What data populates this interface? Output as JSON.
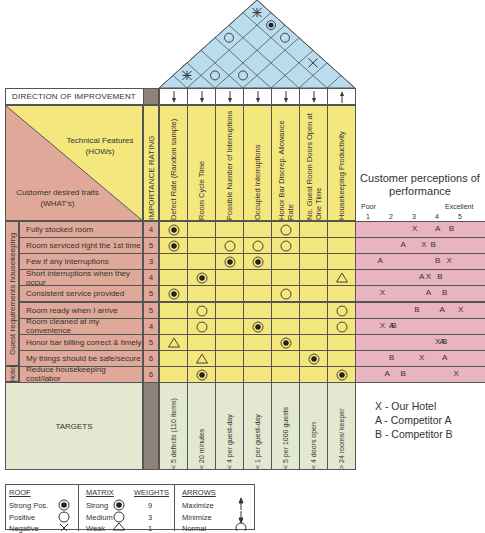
{
  "direction_of_improvement": {
    "label": "DIRECTION OF IMPROVEMENT",
    "arrows": [
      "minimize",
      "minimize",
      "minimize",
      "minimize",
      "minimize",
      "minimize",
      "maximize"
    ]
  },
  "corner": {
    "hows_label": "Technical Features",
    "hows_sub": "(HOWs)",
    "whats_label": "Customer desired traits",
    "whats_sub": "(WHAT's)"
  },
  "importance_header": "IMPORTANCE RATING",
  "technical_features": [
    "Defect Rate (Random sample)",
    "Room Cycle Time",
    "Possible Number of Interruptions",
    "Occupied Interruptions",
    "Honor Bar Discrep. Allowance Rate",
    "No. Guest Room Doors Open at One Time",
    "Housekeeping Productivity"
  ],
  "group_labels": {
    "guest": "Guest requirements housekeeping",
    "hotel": "Hotel"
  },
  "customer_requirements": [
    {
      "label": "Fully stocked room",
      "importance": "4",
      "relations": [
        "strong",
        "",
        "",
        "",
        "medium",
        "",
        ""
      ],
      "perception": {
        "X": 3,
        "A": 4,
        "B": 4.6
      }
    },
    {
      "label": "Room serviced right the 1st time",
      "importance": "5",
      "relations": [
        "strong",
        "",
        "medium",
        "medium",
        "medium",
        "",
        ""
      ],
      "perception": {
        "A": 2.5,
        "X": 3.4,
        "B": 3.8
      }
    },
    {
      "label": "Few if any interruptions",
      "importance": "3",
      "relations": [
        "",
        "",
        "strong",
        "strong",
        "",
        "",
        ""
      ],
      "perception": {
        "A": 1.5,
        "B": 4,
        "X": 4.5
      }
    },
    {
      "label": "Short interruptions when they occur",
      "importance": "4",
      "relations": [
        "",
        "strong",
        "",
        "",
        "",
        "",
        "weak"
      ],
      "perception": {
        "A": 3.3,
        "X": 3.6,
        "B": 4.1
      }
    },
    {
      "label": "Consistent service provided",
      "importance": "5",
      "relations": [
        "strong",
        "",
        "",
        "",
        "medium",
        "",
        ""
      ],
      "perception": {
        "X": 1.6,
        "A": 3.6,
        "B": 4.3
      }
    },
    {
      "label": "Room ready when I arrive",
      "importance": "5",
      "relations": [
        "",
        "medium",
        "",
        "",
        "",
        "",
        "medium"
      ],
      "perception": {
        "B": 3.1,
        "A": 4.2,
        "X": 5
      }
    },
    {
      "label": "Room cleaned at my convenience",
      "importance": "4",
      "relations": [
        "",
        "medium",
        "",
        "strong",
        "",
        "",
        "medium"
      ],
      "perception": {
        "X": 1.6,
        "A": 2,
        "B": 2.1
      }
    },
    {
      "label": "Honor bar billing correct & timely",
      "importance": "5",
      "relations": [
        "weak",
        "",
        "",
        "",
        "strong",
        "",
        ""
      ],
      "perception": {
        "X": 4,
        "A": 4.2,
        "B": 4.3
      }
    },
    {
      "label": "My things should be safe/secure",
      "importance": "6",
      "relations": [
        "",
        "weak",
        "",
        "",
        "",
        "strong",
        ""
      ],
      "perception": {
        "B": 2,
        "X": 3.3,
        "A": 4.3
      }
    },
    {
      "label": "Reduce housekeeping cost/labor",
      "importance": "6",
      "relations": [
        "",
        "strong",
        "",
        "",
        "",
        "",
        "strong"
      ],
      "perception": {
        "A": 1.8,
        "B": 2.5,
        "X": 4.8
      }
    }
  ],
  "targets": {
    "label": "TARGETS",
    "values": [
      "< 5 defects (110 items)",
      "< 20 minutes",
      "< 4 per guest-day",
      "< 1 per guest-day",
      "< 5 per 1000 guests",
      "< 4 doors open",
      "> 24 rooms/ keeper"
    ]
  },
  "roof": [
    {
      "pair": [
        1,
        2
      ],
      "type": "negative-strong"
    },
    {
      "pair": [
        2,
        3
      ],
      "type": "positive"
    },
    {
      "pair": [
        3,
        4
      ],
      "type": "positive"
    },
    {
      "pair": [
        5,
        7
      ],
      "type": "negative"
    },
    {
      "pair": [
        1,
        5
      ],
      "type": "positive"
    },
    {
      "pair": [
        3,
        7
      ],
      "type": "positive"
    },
    {
      "pair": [
        2,
        7
      ],
      "type": "strong-positive"
    },
    {
      "pair": [
        1,
        7
      ],
      "type": "negative-strong"
    }
  ],
  "perceptions": {
    "title_line1": "Customer perceptions of",
    "title_line2": "performance",
    "poor": "Poor",
    "excellent": "Excellent",
    "scale": [
      "1",
      "2",
      "3",
      "4",
      "5"
    ]
  },
  "competitor_key": [
    "X - Our Hotel",
    "A - Competitor A",
    "B - Competitor B"
  ],
  "legend": {
    "roof_title": "ROOF",
    "roof_items": [
      "Strong Pos.",
      "Positive",
      "Negative"
    ],
    "matrix_title": "MATRIX",
    "weights_title": "WEIGHTS",
    "matrix_items": [
      {
        "label": "Strong",
        "weight": "9"
      },
      {
        "label": "Medium",
        "weight": "3"
      },
      {
        "label": "Weak",
        "weight": "1"
      }
    ],
    "arrows_title": "ARROWS",
    "arrows_items": [
      "Maximize",
      "Minimize",
      "Normal"
    ]
  },
  "colors": {
    "roof_fill": "#b9dcef",
    "matrix_yellow": "#f4e77d",
    "whats_pink": "#dfa898",
    "perception_pink": "#e8b4bf",
    "targets_green": "#e3e8d0",
    "importance_gray": "#8c8478"
  }
}
